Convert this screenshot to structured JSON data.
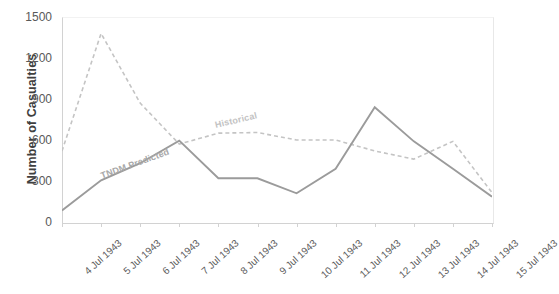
{
  "chart_data": {
    "type": "line",
    "title": "",
    "xlabel": "",
    "ylabel": "Number of Casualties",
    "ylim": [
      0,
      1500
    ],
    "yticks": [
      0,
      300,
      600,
      900,
      1200,
      1500
    ],
    "grid": false,
    "legend_position": "inline-labels",
    "categories": [
      "4 Jul 1943",
      "5 Jul 1943",
      "6 Jul 1943",
      "7 Jul 1943",
      "8 Jul 1943",
      "9 Jul 1943",
      "10 Jul 1943",
      "11 Jul 1943",
      "12 Jul 1943",
      "13 Jul 1943",
      "14 Jul 1943",
      "15 Jul 1943"
    ],
    "series": [
      {
        "name": "TNDM Predicted",
        "style": "solid",
        "color": "#9b9b9b",
        "values": [
          85,
          305,
          430,
          595,
          320,
          320,
          210,
          390,
          840,
          590,
          390,
          185
        ]
      },
      {
        "name": "Historical",
        "style": "dashed",
        "color": "#c4c4c4",
        "values": [
          520,
          1380,
          870,
          570,
          650,
          655,
          600,
          600,
          520,
          460,
          590,
          215
        ]
      }
    ]
  },
  "axis": {
    "y_tick_labels": [
      "1500",
      "1200",
      "900",
      "600",
      "300",
      "0"
    ],
    "y_title": "Number of Casualties"
  },
  "series_labels": {
    "predicted": "TNDM Predicted",
    "historical": "Historical"
  }
}
